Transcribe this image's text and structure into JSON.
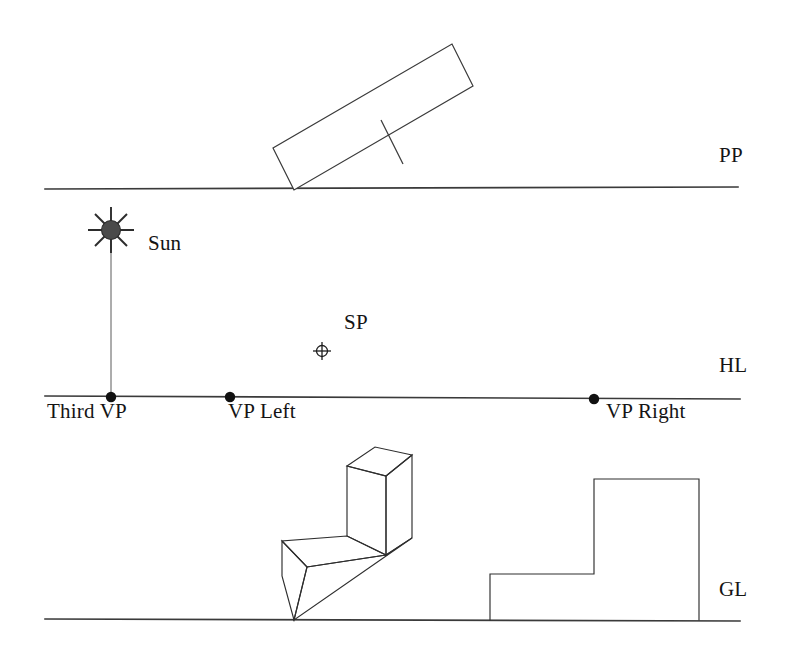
{
  "figure": {
    "background_color": "#ffffff",
    "line_color": "#3a3a3a",
    "sun_color": "#4a4a4a",
    "width": 789,
    "height": 657
  },
  "reference_lines": {
    "picture_plane": {
      "label": "PP",
      "y": 188,
      "x_start": 45,
      "x_end": 738
    },
    "horizon_line": {
      "label": "HL",
      "y": 398,
      "x_start": 45,
      "x_end": 740
    },
    "ground_line": {
      "label": "GL",
      "y": 620,
      "x_start": 45,
      "x_end": 740
    }
  },
  "points": {
    "sun": {
      "label": "Sun",
      "x": 111,
      "y": 230,
      "radius": 9,
      "rays": 8
    },
    "station_point": {
      "label": "SP",
      "x": 322,
      "y": 351,
      "radius": 6
    },
    "third_vp": {
      "label": "Third VP",
      "x": 111,
      "y": 398
    },
    "vp_left": {
      "label": "VP Left",
      "x": 230,
      "y": 398
    },
    "vp_right": {
      "label": "VP Right",
      "x": 594,
      "y": 398
    }
  },
  "plan_view": {
    "name": "tilted rectangular plan with dividing line",
    "corners": [
      [
        294,
        190
      ],
      [
        273,
        148
      ],
      [
        452,
        44
      ],
      [
        473,
        86
      ]
    ],
    "divider": [
      [
        382,
        121
      ],
      [
        403,
        163
      ]
    ]
  },
  "perspective_block": {
    "name": "L-shaped solid in two-point perspective",
    "ground_contact": [
      294,
      620
    ]
  },
  "elevation_view": {
    "name": "stepped elevation profile",
    "outline": [
      [
        490,
        574
      ],
      [
        594,
        574
      ],
      [
        594,
        479
      ],
      [
        699,
        479
      ],
      [
        699,
        620
      ],
      [
        490,
        620
      ]
    ]
  }
}
